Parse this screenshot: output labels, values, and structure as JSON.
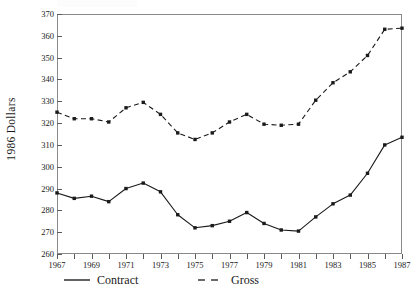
{
  "chart_data": {
    "type": "line",
    "title": "",
    "xlabel": "",
    "ylabel": "1986  Dollars",
    "xlim": [
      1967,
      1987
    ],
    "ylim": [
      260,
      370
    ],
    "yticks": [
      260,
      270,
      280,
      290,
      300,
      310,
      320,
      330,
      340,
      350,
      360,
      370
    ],
    "xticks": [
      1967,
      1968,
      1969,
      1970,
      1971,
      1972,
      1973,
      1974,
      1975,
      1976,
      1977,
      1978,
      1979,
      1980,
      1981,
      1982,
      1983,
      1984,
      1985,
      1986,
      1987
    ],
    "xtick_labels_shown": [
      1967,
      1969,
      1971,
      1973,
      1975,
      1977,
      1979,
      1981,
      1983,
      1985,
      1987
    ],
    "grid": false,
    "legend_position": "below",
    "x": [
      1967,
      1968,
      1969,
      1970,
      1971,
      1972,
      1973,
      1974,
      1975,
      1976,
      1977,
      1978,
      1979,
      1980,
      1981,
      1982,
      1983,
      1984,
      1985,
      1986,
      1987
    ],
    "series": [
      {
        "name": "Contract",
        "style": "solid",
        "color": "#1a1a1a",
        "marker": "filled-square",
        "values": [
          288.0,
          285.5,
          286.5,
          284.0,
          290.0,
          292.5,
          288.5,
          278.0,
          272.0,
          273.0,
          275.0,
          279.0,
          274.0,
          271.0,
          270.5,
          277.0,
          283.0,
          287.0,
          297.0,
          310.0,
          313.5
        ]
      },
      {
        "name": "Gross",
        "style": "dashed",
        "color": "#1a1a1a",
        "marker": "filled-square",
        "values": [
          325.0,
          322.0,
          322.0,
          320.5,
          327.0,
          329.5,
          324.0,
          315.5,
          312.5,
          315.5,
          320.5,
          324.0,
          319.5,
          319.0,
          319.5,
          330.5,
          338.5,
          343.5,
          351.0,
          363.0,
          363.5
        ]
      }
    ]
  },
  "legend": {
    "items": [
      {
        "label": "Contract",
        "style": "solid"
      },
      {
        "label": "Gross",
        "style": "dashed"
      }
    ]
  }
}
